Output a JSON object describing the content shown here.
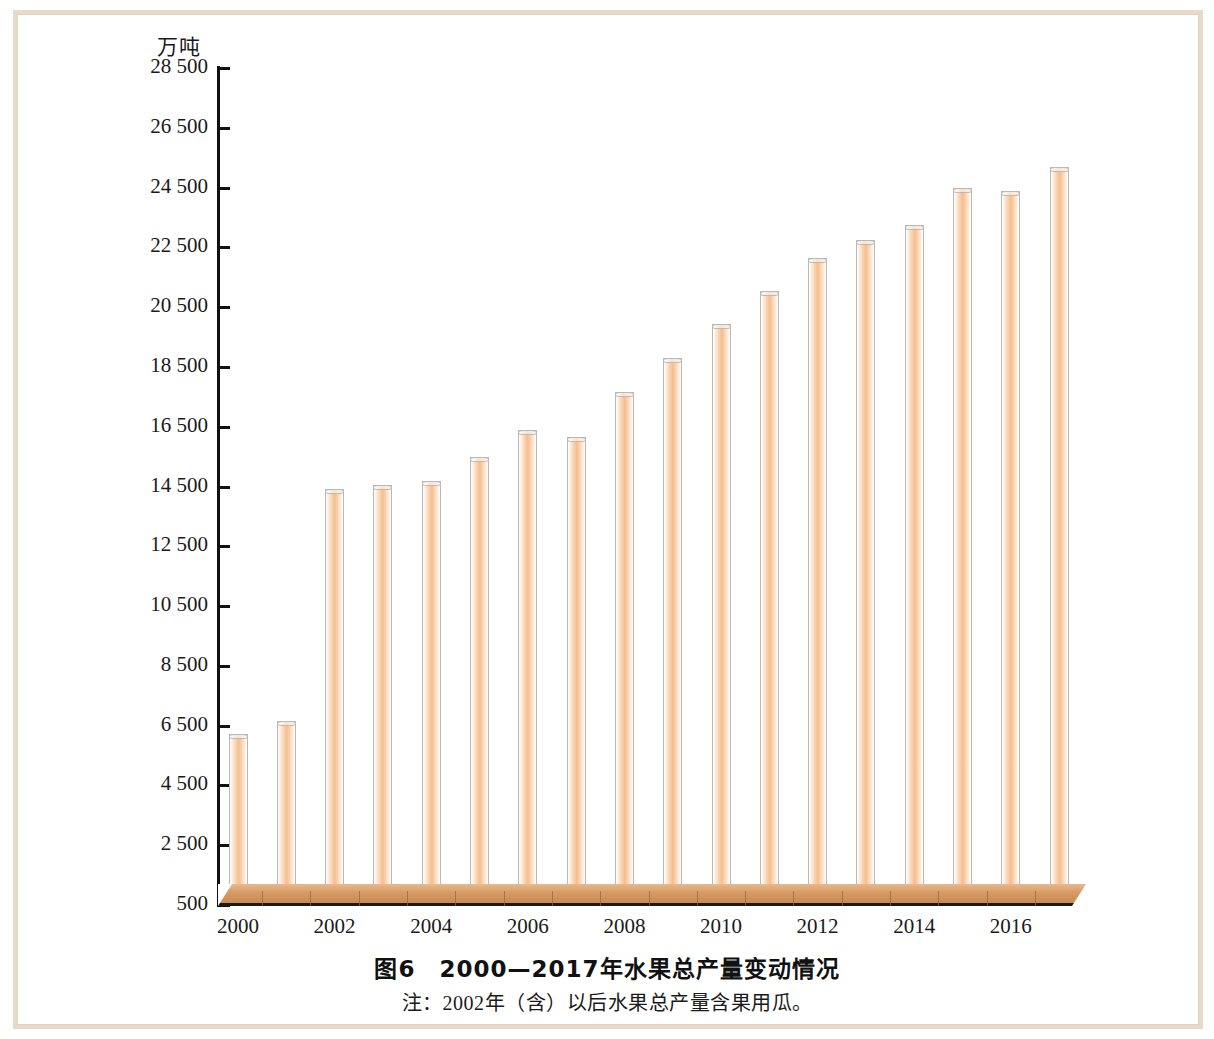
{
  "figure": {
    "caption": "图6　2000—2017年水果总产量变动情况",
    "note": "注：2002年（含）以后水果总产量含果用瓜。",
    "unit_label": "万吨"
  },
  "colors": {
    "bar_fill": "#f6bd8f",
    "bar_edge": "#b9b9b9",
    "platform": "#d79a63",
    "axis": "#111111",
    "page_border": "#e5dcc8",
    "text": "#1a1a1a"
  },
  "chart_data": {
    "type": "bar",
    "title": "图6　2000—2017年水果总产量变动情况",
    "subtitle": "注：2002年（含）以后水果总产量含果用瓜。",
    "xlabel": "",
    "ylabel": "万吨",
    "ylim": [
      500,
      28500
    ],
    "ytick_step": 2000,
    "grid": false,
    "legend": "none",
    "ytick_labels": [
      "28 500",
      "26 500",
      "24 500",
      "22 500",
      "20 500",
      "18 500",
      "16 500",
      "14 500",
      "12 500",
      "10 500",
      "8 500",
      "6 500",
      "4 500",
      "2 500",
      "500"
    ],
    "yticks": [
      28500,
      26500,
      24500,
      22500,
      20500,
      18500,
      16500,
      14500,
      12500,
      10500,
      8500,
      6500,
      4500,
      2500,
      500
    ],
    "categories": [
      "2000",
      "2001",
      "2002",
      "2003",
      "2004",
      "2005",
      "2006",
      "2007",
      "2008",
      "2009",
      "2010",
      "2011",
      "2012",
      "2013",
      "2014",
      "2015",
      "2016",
      "2017"
    ],
    "xtick_labels_shown": [
      "2000",
      "2002",
      "2004",
      "2006",
      "2008",
      "2010",
      "2012",
      "2014",
      "2016"
    ],
    "values": [
      6225,
      6650,
      14400,
      14550,
      14700,
      15500,
      16400,
      16150,
      17650,
      18800,
      19950,
      21050,
      22150,
      22750,
      23250,
      24500,
      24400,
      25200
    ]
  }
}
